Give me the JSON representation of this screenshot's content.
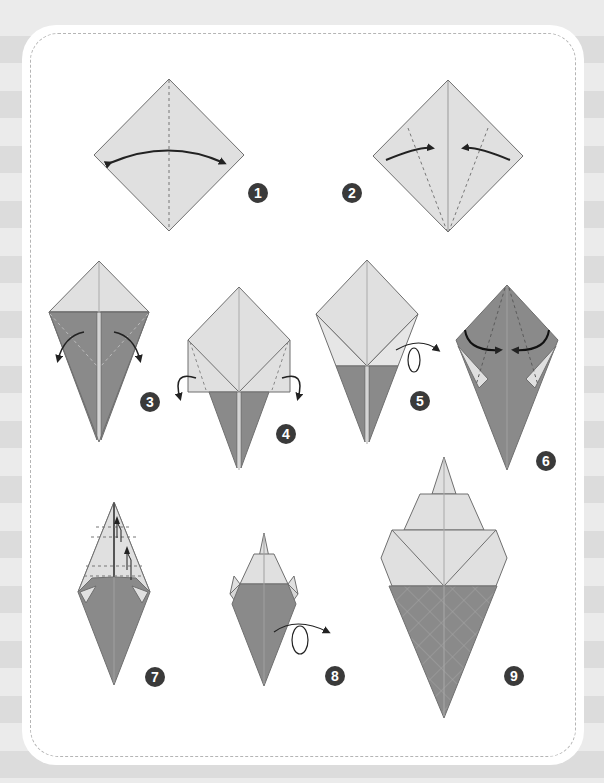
{
  "page": {
    "top_caption": "",
    "colors": {
      "background_stripe_dark": "#dcdcdc",
      "background_stripe_light": "#ebebeb",
      "card": "#ffffff",
      "card_dashed_border": "#b5b5b5",
      "paper_light": "#e0e0e0",
      "paper_dark": "#8a8a8a",
      "outline": "#6f6f6f",
      "arrow": "#222222",
      "badge": "#3a3a3a"
    }
  },
  "diagram": {
    "steps": [
      {
        "number": "1",
        "description": "Fold in half along vertical diagonal and unfold (valley fold, both directions)"
      },
      {
        "number": "2",
        "description": "Fold left and right edges to the center crease"
      },
      {
        "number": "3",
        "description": "Fold the top flaps outward (colored side shows)"
      },
      {
        "number": "4",
        "description": "Fold side corners back"
      },
      {
        "number": "5",
        "description": "Turn the model over"
      },
      {
        "number": "6",
        "description": "Fold the top edges to the center"
      },
      {
        "number": "7",
        "description": "Pleat fold the tip downward twice"
      },
      {
        "number": "8",
        "description": "Turn the model over"
      },
      {
        "number": "9",
        "description": "Completed ice cream cone"
      }
    ]
  }
}
